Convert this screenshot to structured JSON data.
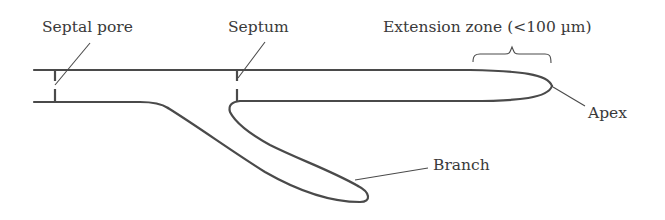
{
  "diagram": {
    "labels": {
      "septal_pore": "Septal pore",
      "septum": "Septum",
      "extension_zone": "Extension zone (<100 µm)",
      "apex": "Apex",
      "branch": "Branch"
    },
    "stroke_color": "#4a4a4a",
    "text_color": "#3a3a3a"
  }
}
